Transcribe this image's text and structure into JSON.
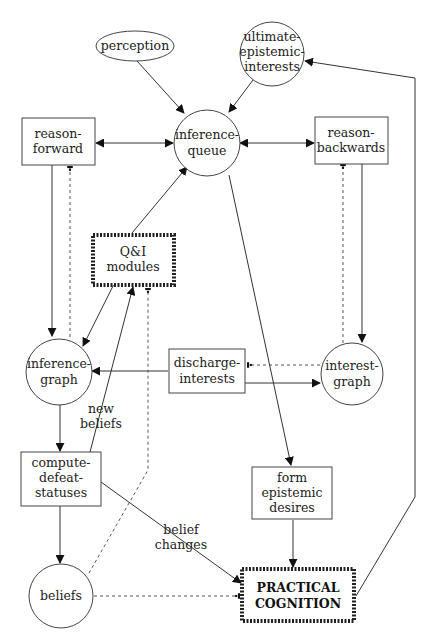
{
  "diagram": {
    "nodes": {
      "perception": {
        "label": "perception",
        "shape": "ellipse"
      },
      "ultimate_epistemic_interests": {
        "lines": [
          "ultimate-",
          "epistemic-",
          "interests"
        ],
        "shape": "circle"
      },
      "reason_forward": {
        "lines": [
          "reason-",
          "forward"
        ],
        "shape": "rect"
      },
      "inference_queue": {
        "lines": [
          "inference-",
          "queue"
        ],
        "shape": "circle"
      },
      "reason_backwards": {
        "lines": [
          "reason-",
          "backwards"
        ],
        "shape": "rect"
      },
      "qi_modules": {
        "lines": [
          "Q&I",
          "modules"
        ],
        "shape": "thick-rect"
      },
      "inference_graph": {
        "lines": [
          "inference-",
          "graph"
        ],
        "shape": "circle"
      },
      "discharge_interests": {
        "lines": [
          "discharge-",
          "interests"
        ],
        "shape": "rect"
      },
      "interest_graph": {
        "lines": [
          "interest-",
          "graph"
        ],
        "shape": "circle"
      },
      "compute_defeat_statuses": {
        "lines": [
          "compute-",
          "defeat-",
          "statuses"
        ],
        "shape": "rect"
      },
      "form_epistemic_desires": {
        "lines": [
          "form",
          "epistemic",
          "desires"
        ],
        "shape": "rect"
      },
      "beliefs": {
        "label": "beliefs",
        "shape": "circle"
      },
      "practical_cognition": {
        "lines": [
          "PRACTICAL",
          "COGNITION"
        ],
        "shape": "thick-rect"
      }
    },
    "edge_labels": {
      "new_beliefs": [
        "new",
        "beliefs"
      ],
      "belief_changes": [
        "belief",
        "changes"
      ]
    },
    "edges": [
      {
        "from": "perception",
        "to": "inference-queue",
        "style": "solid"
      },
      {
        "from": "ultimate-epistemic-interests",
        "to": "inference-queue",
        "style": "solid"
      },
      {
        "from": "reason-forward",
        "to": "inference-queue",
        "style": "solid-bidirectional"
      },
      {
        "from": "inference-queue",
        "to": "reason-backwards",
        "style": "solid-bidirectional"
      },
      {
        "from": "Q&I modules",
        "to": "inference-queue",
        "style": "solid"
      },
      {
        "from": "reason-forward",
        "to": "inference-graph",
        "style": "solid"
      },
      {
        "from": "inference-graph",
        "to": "reason-forward",
        "style": "dashed-inhibit"
      },
      {
        "from": "Q&I modules",
        "to": "inference-graph",
        "style": "solid"
      },
      {
        "from": "reason-backwards",
        "to": "interest-graph",
        "style": "solid"
      },
      {
        "from": "interest-graph",
        "to": "reason-backwards",
        "style": "dashed-inhibit"
      },
      {
        "from": "discharge-interests",
        "to": "inference-graph",
        "style": "solid"
      },
      {
        "from": "discharge-interests",
        "to": "interest-graph",
        "style": "solid"
      },
      {
        "from": "interest-graph",
        "to": "discharge-interests",
        "style": "dashed-inhibit"
      },
      {
        "from": "compute-defeat-statuses",
        "to": "Q&I modules",
        "style": "solid",
        "label": "new beliefs"
      },
      {
        "from": "inference-graph",
        "to": "compute-defeat-statuses",
        "style": "solid"
      },
      {
        "from": "compute-defeat-statuses",
        "to": "beliefs",
        "style": "solid"
      },
      {
        "from": "beliefs",
        "to": "Q&I modules",
        "style": "dashed-inhibit"
      },
      {
        "from": "inference-queue",
        "to": "form-epistemic-desires",
        "style": "solid"
      },
      {
        "from": "form-epistemic-desires",
        "to": "PRACTICAL COGNITION",
        "style": "solid"
      },
      {
        "from": "compute-defeat-statuses",
        "to": "PRACTICAL COGNITION",
        "style": "solid",
        "label": "belief changes"
      },
      {
        "from": "beliefs",
        "to": "PRACTICAL COGNITION",
        "style": "dashed-inhibit"
      },
      {
        "from": "PRACTICAL COGNITION",
        "to": "ultimate-epistemic-interests",
        "style": "solid"
      }
    ]
  }
}
